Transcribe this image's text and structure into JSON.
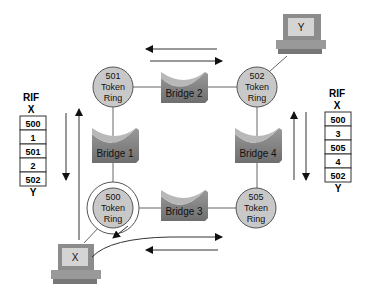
{
  "rings": [
    {
      "id": "501",
      "number": "501",
      "line1": "Token",
      "line2": "Ring"
    },
    {
      "id": "502",
      "number": "502",
      "line1": "Token",
      "line2": "Ring"
    },
    {
      "id": "500",
      "number": "500",
      "line1": "Token",
      "line2": "Ring"
    },
    {
      "id": "505",
      "number": "505",
      "line1": "Token",
      "line2": "Ring"
    }
  ],
  "bridges": [
    {
      "id": "bridge-1",
      "label": "Bridge 1"
    },
    {
      "id": "bridge-2",
      "label": "Bridge 2"
    },
    {
      "id": "bridge-3",
      "label": "Bridge 3"
    },
    {
      "id": "bridge-4",
      "label": "Bridge 4"
    }
  ],
  "hosts": {
    "x": {
      "label": "X"
    },
    "y": {
      "label": "Y"
    }
  },
  "rif_left": {
    "title": "RIF",
    "top": "X",
    "rows": [
      "500",
      "1",
      "501",
      "2",
      "502"
    ],
    "bottom": "Y"
  },
  "rif_right": {
    "title": "RIF",
    "top": "X",
    "rows": [
      "500",
      "3",
      "505",
      "4",
      "502"
    ],
    "bottom": "Y"
  },
  "colors": {
    "ring_fill": "#c8c8c8",
    "bridge_fill": "#8a8a8a",
    "bridge_top": "#b0b0b0",
    "line": "#555555"
  }
}
